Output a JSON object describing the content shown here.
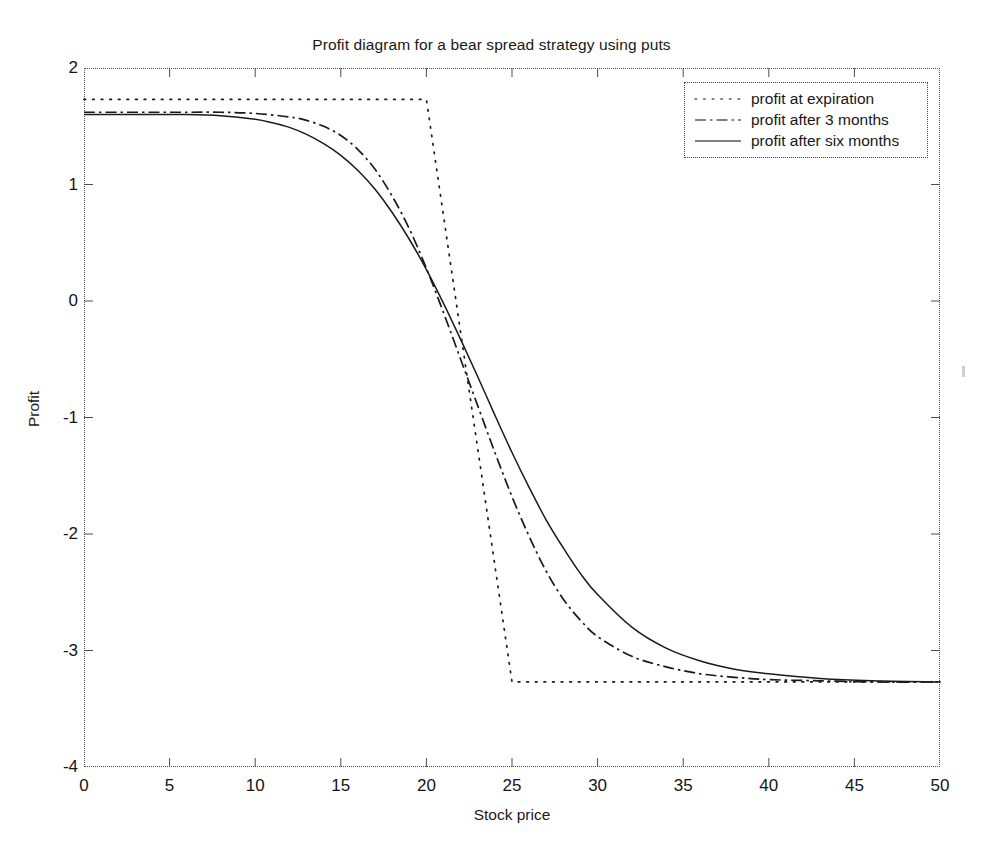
{
  "chart_data": {
    "type": "line",
    "title": "Profit diagram for a bear spread strategy using puts",
    "xlabel": "Stock price",
    "ylabel": "Profit",
    "xlim": [
      0,
      50
    ],
    "ylim": [
      -4,
      2
    ],
    "xticks": [
      0,
      5,
      10,
      15,
      20,
      25,
      30,
      35,
      40,
      45,
      50
    ],
    "yticks": [
      2,
      1,
      0,
      -1,
      -2,
      -3,
      -4
    ],
    "grid": false,
    "legend_position": "top-right",
    "legend": [
      "profit at expiration",
      "profit after 3 months",
      "profit after six months"
    ],
    "series": [
      {
        "name": "profit at expiration",
        "style": "dotted",
        "max_profit": 1.73,
        "max_loss": -3.27,
        "lower_strike": 20,
        "upper_strike": 25,
        "x": [
          0,
          2,
          4,
          6,
          8,
          10,
          12,
          14,
          16,
          18,
          20,
          21,
          22,
          23,
          24,
          25,
          27,
          30,
          35,
          40,
          45,
          50
        ],
        "y": [
          1.73,
          1.73,
          1.73,
          1.73,
          1.73,
          1.73,
          1.73,
          1.73,
          1.73,
          1.73,
          1.73,
          0.73,
          -0.27,
          -1.27,
          -2.27,
          -3.27,
          -3.27,
          -3.27,
          -3.27,
          -3.27,
          -3.27,
          -3.27
        ]
      },
      {
        "name": "profit after 3 months",
        "style": "dash-dot",
        "x": [
          0,
          2,
          4,
          6,
          8,
          10,
          12,
          13,
          14,
          15,
          16,
          17,
          18,
          19,
          20,
          21,
          22,
          23,
          24,
          25,
          26,
          27,
          28,
          29,
          30,
          32,
          34,
          36,
          38,
          40,
          43,
          46,
          50
        ],
        "y": [
          1.62,
          1.62,
          1.62,
          1.62,
          1.62,
          1.61,
          1.58,
          1.55,
          1.5,
          1.42,
          1.3,
          1.13,
          0.9,
          0.62,
          0.28,
          -0.1,
          -0.5,
          -0.9,
          -1.3,
          -1.68,
          -2.02,
          -2.32,
          -2.56,
          -2.74,
          -2.88,
          -3.05,
          -3.14,
          -3.2,
          -3.23,
          -3.25,
          -3.26,
          -3.27,
          -3.27
        ]
      },
      {
        "name": "profit after six months",
        "style": "solid",
        "x": [
          0,
          2,
          4,
          6,
          8,
          10,
          11,
          12,
          13,
          14,
          15,
          16,
          17,
          18,
          19,
          20,
          21,
          22,
          23,
          24,
          25,
          26,
          27,
          28,
          29,
          30,
          32,
          34,
          36,
          38,
          40,
          43,
          46,
          50
        ],
        "y": [
          1.6,
          1.6,
          1.6,
          1.6,
          1.59,
          1.56,
          1.53,
          1.49,
          1.43,
          1.35,
          1.25,
          1.12,
          0.96,
          0.76,
          0.53,
          0.27,
          -0.02,
          -0.33,
          -0.65,
          -0.98,
          -1.3,
          -1.6,
          -1.88,
          -2.12,
          -2.34,
          -2.52,
          -2.8,
          -2.98,
          -3.09,
          -3.16,
          -3.2,
          -3.24,
          -3.26,
          -3.27
        ]
      }
    ]
  },
  "colors": {
    "line": "#1a1a1a",
    "axis": "#4f4f4f",
    "background": "#ffffff",
    "text": "#171717"
  }
}
